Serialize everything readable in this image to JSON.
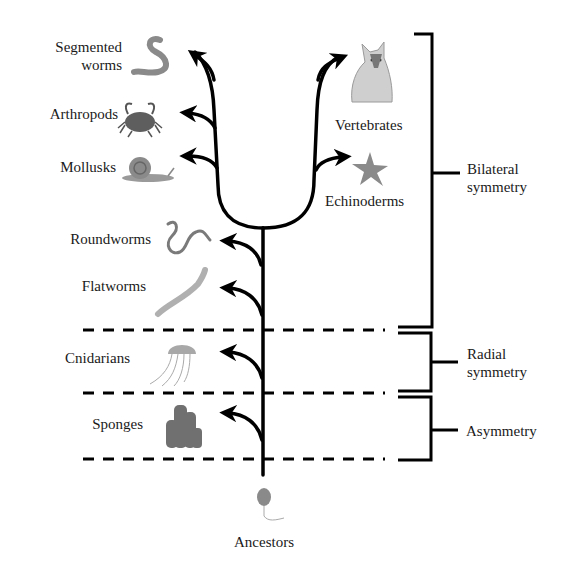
{
  "diagram": {
    "type": "phylogenetic-tree",
    "root": "Ancestors",
    "colors": {
      "line": "#000000",
      "text": "#1a1a1a",
      "illustration": "#7a7a7a",
      "background": "#ffffff"
    },
    "taxa": {
      "segmented_worms": {
        "line1": "Segmented",
        "line2": "worms",
        "icon": "worm-icon"
      },
      "arthropods": {
        "label": "Arthropods",
        "icon": "crab-icon"
      },
      "mollusks": {
        "label": "Mollusks",
        "icon": "snail-icon"
      },
      "vertebrates": {
        "label": "Vertebrates",
        "icon": "dog-icon"
      },
      "echinoderms": {
        "label": "Echinoderms",
        "icon": "starfish-icon"
      },
      "roundworms": {
        "label": "Roundworms",
        "icon": "roundworm-icon"
      },
      "flatworms": {
        "label": "Flatworms",
        "icon": "flatworm-icon"
      },
      "cnidarians": {
        "label": "Cnidarians",
        "icon": "jellyfish-icon"
      },
      "sponges": {
        "label": "Sponges",
        "icon": "sponge-icon"
      },
      "ancestors": {
        "label": "Ancestors",
        "icon": "choanoflagellate-icon"
      }
    },
    "groups": {
      "bilateral": {
        "line1": "Bilateral",
        "line2": "symmetry",
        "members": [
          "Segmented worms",
          "Arthropods",
          "Mollusks",
          "Vertebrates",
          "Echinoderms",
          "Roundworms",
          "Flatworms"
        ]
      },
      "radial": {
        "line1": "Radial",
        "line2": "symmetry",
        "members": [
          "Cnidarians"
        ]
      },
      "asymmetry": {
        "label": "Asymmetry",
        "members": [
          "Sponges"
        ]
      }
    }
  }
}
